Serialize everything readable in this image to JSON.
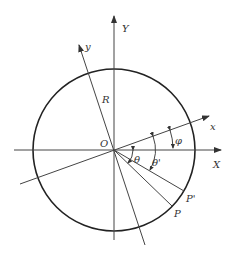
{
  "diagram": {
    "type": "geometry",
    "labels": {
      "Y": "Y",
      "X": "X",
      "y": "y",
      "x": "x",
      "R": "R",
      "O": "O",
      "theta": "θ",
      "theta_prime": "θ'",
      "phi": "φ",
      "P": "P",
      "P_prime": "P'"
    },
    "colors": {
      "line": "#444444",
      "circle": "#222222",
      "text": "#333333"
    }
  }
}
